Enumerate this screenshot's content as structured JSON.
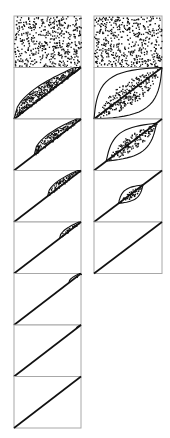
{
  "figure": {
    "width": 170,
    "height": 438,
    "frame_color": "#a8a8a8",
    "ink_color": "#111111",
    "columns": [
      {
        "name": "left-column",
        "x": 14,
        "y": 16,
        "panel_width": 67,
        "panel_height": 51.5,
        "panels": [
          {
            "fill": "full",
            "density": 520
          },
          {
            "fill": "curve",
            "lower": 0.0,
            "bow": 1.0,
            "density": 330
          },
          {
            "fill": "curve",
            "lower": 0.3,
            "bow": 0.75,
            "density": 150
          },
          {
            "fill": "curve",
            "lower": 0.5,
            "bow": 0.55,
            "density": 80
          },
          {
            "fill": "curve",
            "lower": 0.68,
            "bow": 0.4,
            "density": 40
          },
          {
            "fill": "curve",
            "lower": 0.82,
            "bow": 0.3,
            "density": 18
          },
          {
            "fill": "curve",
            "lower": 0.93,
            "bow": 0.18,
            "density": 5
          },
          {
            "fill": "none",
            "density": 0
          }
        ]
      },
      {
        "name": "right-column",
        "x": 94,
        "y": 16,
        "panel_width": 68,
        "panel_height": 51.5,
        "panels": [
          {
            "fill": "full",
            "density": 520
          },
          {
            "fill": "lens",
            "t0": 0.0,
            "t1": 1.0,
            "width": 0.55,
            "density": 260
          },
          {
            "fill": "lens",
            "t0": 0.18,
            "t1": 0.92,
            "width": 0.34,
            "density": 150
          },
          {
            "fill": "lens",
            "t0": 0.36,
            "t1": 0.72,
            "width": 0.16,
            "density": 50
          },
          {
            "fill": "none",
            "density": 0
          }
        ]
      }
    ]
  }
}
